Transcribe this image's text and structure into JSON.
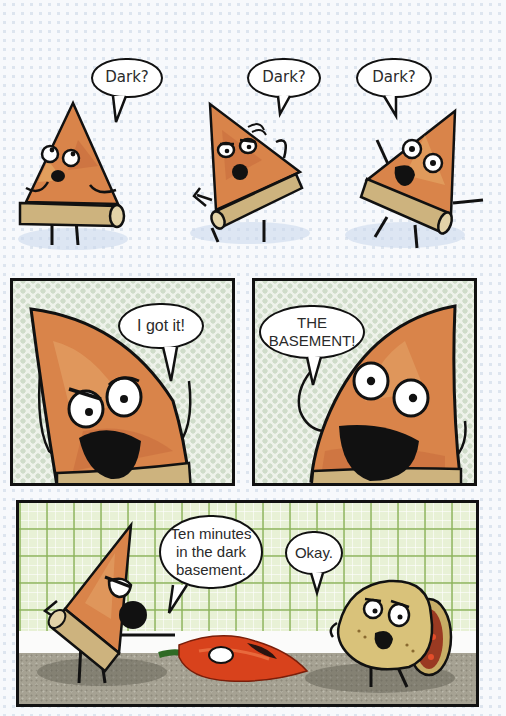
{
  "comic": {
    "row1": {
      "bubbles": [
        {
          "text": "Dark?"
        },
        {
          "text": "Dark?"
        },
        {
          "text": "Dark?"
        }
      ],
      "characters": [
        "pizza-slice-worried",
        "pizza-slice-confused",
        "pizza-slice-scared"
      ]
    },
    "panel2": {
      "bubble": {
        "text": "I got it!"
      },
      "character": "pizza-slice-scheming"
    },
    "panel3": {
      "bubble": {
        "line1": "THE",
        "line2": "BASEMENT!"
      },
      "character": "pizza-slice-excited"
    },
    "panel4": {
      "bubble_pizza": {
        "line1": "Ten minutes",
        "line2": "in the dark",
        "line3": "basement."
      },
      "bubble_taco": {
        "text": "Okay."
      },
      "characters": [
        "pizza-slice-pointing",
        "red-pepper",
        "taco-sad"
      ]
    },
    "colors": {
      "ink": "#111111",
      "pizza": "#d9844a",
      "crust": "#cdb37e",
      "wall_green": "#e8f1d6",
      "floor": "#a39f90",
      "pepper": "#d8421c"
    }
  }
}
